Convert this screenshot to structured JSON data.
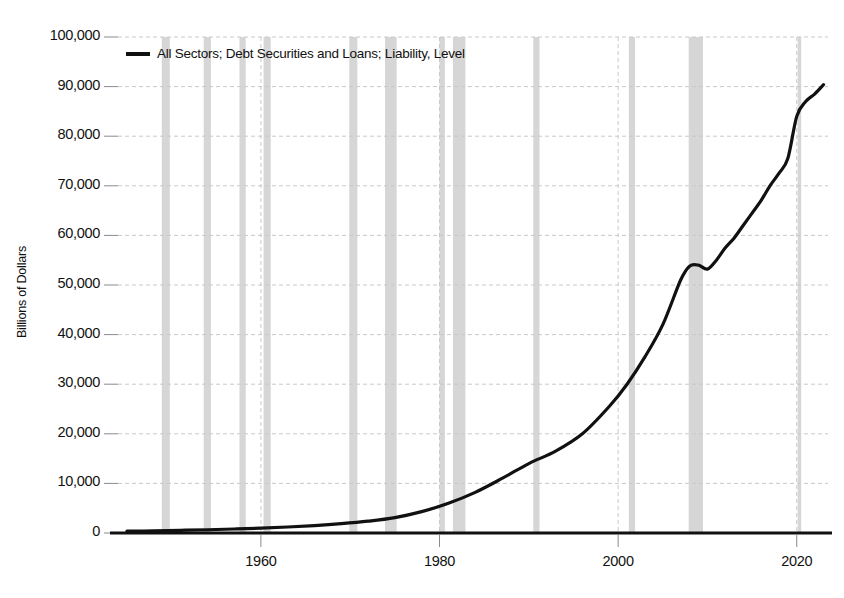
{
  "chart_data": {
    "type": "line",
    "title": "",
    "subtitle": "",
    "xlabel": "",
    "ylabel": "Billions of Dollars",
    "legend": [
      {
        "name": "All Sectors; Debt Securities and Loans; Liability, Level",
        "color": "#111111"
      }
    ],
    "legend_position": "top-left-inside",
    "grid": true,
    "grid_color": "#c9c9c9",
    "background": "#ffffff",
    "line_color": "#111111",
    "line_width": 3.2,
    "xlim": [
      1944,
      2023.5
    ],
    "ylim": [
      0,
      100000
    ],
    "yticks": [
      0,
      10000,
      20000,
      30000,
      40000,
      50000,
      60000,
      70000,
      80000,
      90000,
      100000
    ],
    "ytick_labels": [
      "0",
      "10,000",
      "20,000",
      "30,000",
      "40,000",
      "50,000",
      "60,000",
      "70,000",
      "80,000",
      "90,000",
      "100,000"
    ],
    "xticks": [
      1960,
      1980,
      2000,
      2020
    ],
    "xtick_labels": [
      "1960",
      "1980",
      "2000",
      "2020"
    ],
    "shaded_bands": {
      "label": "recession-bands",
      "color": "#d6d6d6",
      "intervals": [
        [
          1948.9,
          1949.8
        ],
        [
          1953.6,
          1954.4
        ],
        [
          1957.6,
          1958.3
        ],
        [
          1960.3,
          1961.1
        ],
        [
          1969.9,
          1970.8
        ],
        [
          1973.9,
          1975.2
        ],
        [
          1980.0,
          1980.6
        ],
        [
          1981.5,
          1982.9
        ],
        [
          1990.5,
          1991.2
        ],
        [
          2001.2,
          2001.9
        ],
        [
          2007.9,
          2009.5
        ],
        [
          2020.1,
          2020.5
        ]
      ]
    },
    "series": [
      {
        "name": "All Sectors; Debt Securities and Loans; Liability, Level",
        "x": [
          1945,
          1948,
          1951,
          1954,
          1957,
          1960,
          1963,
          1966,
          1969,
          1972,
          1975,
          1978,
          1981,
          1984,
          1987,
          1990,
          1993,
          1996,
          1999,
          2001,
          2003,
          2005,
          2007,
          2008,
          2009,
          2010,
          2011,
          2012,
          2013,
          2014,
          2015,
          2016,
          2017,
          2018,
          2019,
          2020,
          2021,
          2022,
          2023
        ],
        "y": [
          360,
          430,
          540,
          660,
          810,
          980,
          1210,
          1500,
          1880,
          2380,
          3100,
          4300,
          6000,
          8200,
          11000,
          14000,
          16500,
          20000,
          25500,
          30000,
          35500,
          42000,
          51000,
          53800,
          54000,
          53200,
          55000,
          57500,
          59500,
          62000,
          64500,
          67000,
          70000,
          72500,
          75500,
          84000,
          87000,
          88500,
          90400
        ]
      }
    ]
  }
}
